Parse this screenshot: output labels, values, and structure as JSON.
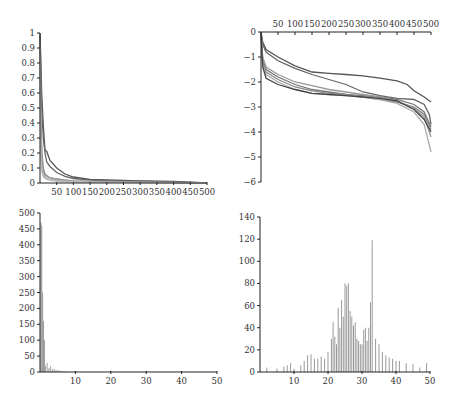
{
  "chart_data": [
    {
      "id": "top-left",
      "type": "line",
      "title": "",
      "xlabel": "",
      "ylabel": "",
      "xlim": [
        0,
        500
      ],
      "ylim": [
        0,
        1
      ],
      "x_ticks": [
        50,
        100,
        150,
        200,
        250,
        300,
        350,
        400,
        450,
        500
      ],
      "y_ticks": [
        0,
        0.1,
        0.2,
        0.3,
        0.4,
        0.5,
        0.6,
        0.7,
        0.8,
        0.9,
        1
      ],
      "grid": false,
      "legend": null,
      "series": [
        {
          "name": "s1",
          "color": "#555555",
          "x": [
            0,
            5,
            10,
            15,
            20,
            30,
            50,
            75,
            100,
            150,
            200,
            300,
            400,
            500
          ],
          "y": [
            1.0,
            0.6,
            0.38,
            0.22,
            0.21,
            0.15,
            0.1,
            0.06,
            0.04,
            0.025,
            0.02,
            0.015,
            0.01,
            0.0
          ]
        },
        {
          "name": "s2",
          "color": "#666666",
          "x": [
            0,
            5,
            10,
            15,
            20,
            30,
            50,
            75,
            100,
            150,
            200,
            300,
            400,
            500
          ],
          "y": [
            0.98,
            0.5,
            0.3,
            0.2,
            0.14,
            0.11,
            0.07,
            0.045,
            0.03,
            0.02,
            0.015,
            0.012,
            0.008,
            0.0
          ]
        },
        {
          "name": "s3",
          "color": "#888888",
          "x": [
            0,
            3,
            6,
            10,
            15,
            25,
            40,
            70,
            100,
            200,
            300,
            400,
            500
          ],
          "y": [
            0.95,
            0.4,
            0.2,
            0.1,
            0.06,
            0.04,
            0.03,
            0.02,
            0.015,
            0.01,
            0.008,
            0.005,
            0.0
          ]
        },
        {
          "name": "s4",
          "color": "#999999",
          "x": [
            0,
            3,
            6,
            10,
            15,
            25,
            40,
            70,
            100,
            200,
            300,
            400,
            500
          ],
          "y": [
            0.9,
            0.3,
            0.15,
            0.08,
            0.05,
            0.04,
            0.03,
            0.02,
            0.012,
            0.008,
            0.005,
            0.003,
            0.0
          ]
        },
        {
          "name": "s5",
          "color": "#aaaaaa",
          "x": [
            0,
            2,
            5,
            10,
            20,
            40,
            70,
            100,
            200,
            300,
            400,
            500
          ],
          "y": [
            0.85,
            0.25,
            0.1,
            0.05,
            0.03,
            0.02,
            0.015,
            0.01,
            0.006,
            0.004,
            0.002,
            0.0
          ]
        },
        {
          "name": "s6",
          "color": "#bbbbbb",
          "x": [
            0,
            2,
            5,
            10,
            20,
            40,
            70,
            100,
            200,
            300,
            400,
            500
          ],
          "y": [
            0.8,
            0.2,
            0.08,
            0.04,
            0.025,
            0.015,
            0.01,
            0.008,
            0.005,
            0.003,
            0.002,
            0.0
          ]
        }
      ]
    },
    {
      "id": "top-right",
      "type": "line",
      "title": "",
      "xlabel": "",
      "ylabel": "",
      "xlim": [
        0,
        500
      ],
      "ylim": [
        -6,
        0
      ],
      "x_axis_position": "top",
      "x_ticks": [
        50,
        100,
        150,
        200,
        250,
        300,
        350,
        400,
        450,
        500
      ],
      "y_ticks": [
        0,
        -1,
        -2,
        -3,
        -4,
        -5,
        -6
      ],
      "grid": false,
      "legend": null,
      "series": [
        {
          "name": "s1",
          "color": "#555555",
          "x": [
            0,
            5,
            15,
            50,
            100,
            150,
            200,
            250,
            300,
            350,
            400,
            430,
            450,
            480,
            500
          ],
          "y": [
            0,
            -0.4,
            -0.7,
            -1.0,
            -1.35,
            -1.6,
            -1.65,
            -1.7,
            -1.75,
            -1.85,
            -1.95,
            -2.1,
            -2.35,
            -2.6,
            -2.8
          ]
        },
        {
          "name": "s2",
          "color": "#666666",
          "x": [
            0,
            5,
            15,
            50,
            100,
            150,
            200,
            250,
            300,
            350,
            400,
            450,
            480,
            495,
            500
          ],
          "y": [
            0,
            -0.5,
            -0.8,
            -1.15,
            -1.45,
            -1.7,
            -1.9,
            -2.1,
            -2.4,
            -2.55,
            -2.65,
            -2.7,
            -2.9,
            -3.3,
            -3.7
          ]
        },
        {
          "name": "s3",
          "color": "#777777",
          "x": [
            0,
            5,
            15,
            50,
            100,
            150,
            200,
            250,
            300,
            350,
            400,
            450,
            480,
            500
          ],
          "y": [
            0,
            -1.1,
            -1.5,
            -1.8,
            -2.1,
            -2.3,
            -2.4,
            -2.5,
            -2.55,
            -2.6,
            -2.7,
            -2.9,
            -3.2,
            -3.8
          ]
        },
        {
          "name": "s4",
          "color": "#8a8a8a",
          "x": [
            0,
            5,
            15,
            50,
            100,
            150,
            200,
            250,
            300,
            350,
            400,
            450,
            480,
            500
          ],
          "y": [
            0,
            -1.2,
            -1.6,
            -1.9,
            -2.2,
            -2.35,
            -2.45,
            -2.5,
            -2.6,
            -2.7,
            -2.8,
            -3.0,
            -3.3,
            -3.9
          ]
        },
        {
          "name": "s5",
          "color": "#999999",
          "x": [
            0,
            5,
            15,
            50,
            100,
            150,
            200,
            250,
            300,
            350,
            400,
            450,
            480,
            500
          ],
          "y": [
            0,
            -1.0,
            -1.4,
            -1.7,
            -2.0,
            -2.15,
            -2.3,
            -2.4,
            -2.5,
            -2.6,
            -2.75,
            -3.05,
            -3.4,
            -4.2
          ]
        },
        {
          "name": "s6",
          "color": "#aaaaaa",
          "x": [
            0,
            5,
            15,
            50,
            100,
            150,
            200,
            250,
            300,
            350,
            400,
            450,
            480,
            500
          ],
          "y": [
            0,
            -1.3,
            -1.7,
            -2.0,
            -2.3,
            -2.45,
            -2.5,
            -2.55,
            -2.6,
            -2.7,
            -2.85,
            -3.2,
            -3.7,
            -4.8
          ]
        },
        {
          "name": "s7",
          "color": "#444444",
          "x": [
            0,
            5,
            15,
            50,
            100,
            150,
            200,
            250,
            300,
            350,
            400,
            450,
            480,
            500
          ],
          "y": [
            0,
            -1.4,
            -1.85,
            -2.1,
            -2.3,
            -2.45,
            -2.5,
            -2.55,
            -2.6,
            -2.65,
            -2.75,
            -3.1,
            -3.5,
            -4.0
          ]
        }
      ]
    },
    {
      "id": "bottom-left",
      "type": "bar",
      "title": "",
      "xlabel": "",
      "ylabel": "",
      "xlim": [
        0,
        50
      ],
      "ylim": [
        0,
        500
      ],
      "x_ticks": [
        10,
        20,
        30,
        40,
        50
      ],
      "y_ticks": [
        0,
        50,
        100,
        150,
        200,
        250,
        300,
        350,
        400,
        450,
        500
      ],
      "grid": false,
      "legend": null,
      "color": "#999999",
      "x": [
        0.25,
        0.5,
        0.75,
        1.0,
        1.25,
        1.5,
        2.0,
        2.5,
        3.0,
        3.5,
        4.0,
        4.5,
        5.0,
        5.5,
        6.0,
        6.5,
        7.0,
        8.0
      ],
      "values": [
        470,
        460,
        250,
        160,
        100,
        20,
        28,
        12,
        18,
        8,
        10,
        5,
        6,
        4,
        3,
        2,
        2,
        1
      ]
    },
    {
      "id": "bottom-right",
      "type": "bar",
      "title": "",
      "xlabel": "",
      "ylabel": "",
      "xlim": [
        0,
        50
      ],
      "ylim": [
        0,
        140
      ],
      "x_ticks": [
        10,
        20,
        30,
        40,
        50
      ],
      "y_ticks": [
        0,
        20,
        40,
        60,
        80,
        100,
        120,
        140
      ],
      "grid": false,
      "legend": null,
      "color": "#999999",
      "x": [
        2,
        5,
        7,
        8,
        9,
        10,
        12,
        13,
        14,
        15,
        16,
        17,
        18,
        19,
        20,
        21,
        21.5,
        22,
        22.5,
        23,
        23.5,
        24,
        24.5,
        25,
        25.5,
        26,
        26.5,
        27,
        27.5,
        28,
        28.5,
        29,
        29.5,
        30,
        30.5,
        31,
        31.5,
        32,
        32.5,
        33,
        34,
        35,
        36,
        37,
        38,
        39,
        40,
        41,
        43,
        45,
        47,
        49
      ],
      "values": [
        4,
        3,
        5,
        6,
        8,
        3,
        6,
        10,
        15,
        16,
        12,
        12,
        14,
        12,
        18,
        30,
        45,
        32,
        25,
        58,
        40,
        65,
        50,
        80,
        78,
        80,
        55,
        50,
        42,
        45,
        30,
        28,
        25,
        25,
        38,
        40,
        28,
        40,
        63,
        119,
        30,
        25,
        18,
        15,
        13,
        12,
        10,
        10,
        8,
        7,
        4,
        8
      ]
    }
  ]
}
